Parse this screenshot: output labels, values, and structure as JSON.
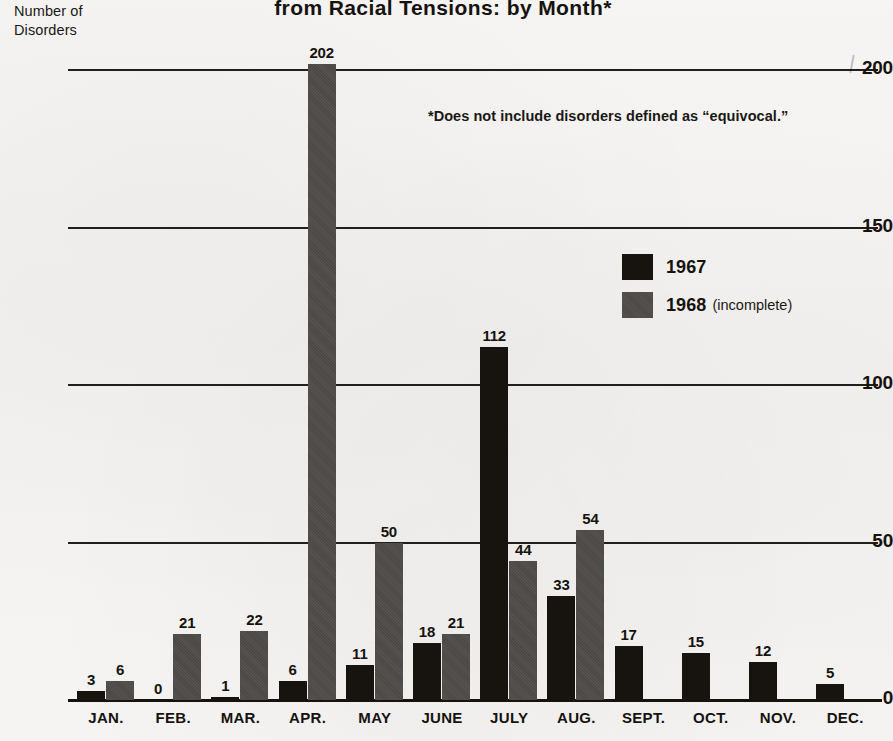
{
  "chart_data": {
    "type": "bar",
    "title": "from Racial Tensions: by Month*",
    "ylabel_line1": "Number of",
    "ylabel_line2": "Disorders",
    "xlabel": "",
    "footnote": "*Does not include disorders defined as “equivocal.”",
    "ylim": [
      0,
      210
    ],
    "yticks": [
      0,
      50,
      100,
      150,
      200
    ],
    "ytick_labels": [
      "0",
      "50",
      "100",
      "150",
      "200"
    ],
    "grid": true,
    "legend_position": "upper right",
    "categories": [
      "JAN.",
      "FEB.",
      "MAR.",
      "APR.",
      "MAY",
      "JUNE",
      "JULY",
      "AUG.",
      "SEPT.",
      "OCT.",
      "NOV.",
      "DEC."
    ],
    "series": [
      {
        "name": "1967",
        "legend_label": "1967",
        "legend_note": "",
        "color": "#17140f",
        "values": [
          3,
          0,
          1,
          6,
          11,
          18,
          112,
          33,
          17,
          15,
          12,
          5
        ]
      },
      {
        "name": "1968",
        "legend_label": "1968",
        "legend_note": "(incomplete)",
        "color": "#4b4845",
        "values": [
          6,
          21,
          22,
          202,
          50,
          21,
          44,
          54,
          null,
          null,
          null,
          null
        ]
      }
    ]
  }
}
